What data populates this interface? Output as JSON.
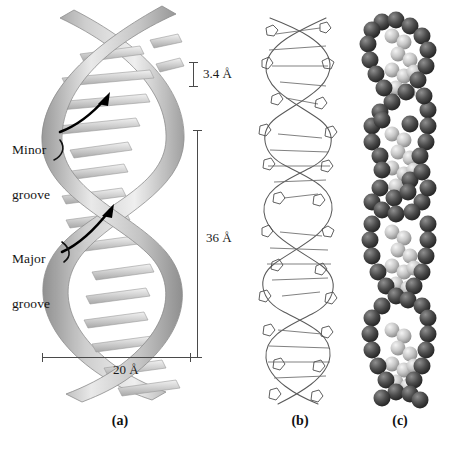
{
  "figure": {
    "background_color": "#ffffff",
    "panels": [
      {
        "id": "a",
        "letter": "(a)",
        "model": "ribbon-helix-schematic"
      },
      {
        "id": "b",
        "letter": "(b)",
        "model": "stick-wireframe-model"
      },
      {
        "id": "c",
        "letter": "(c)",
        "model": "space-filling-model"
      }
    ]
  },
  "annotations": {
    "minor_groove": "Minor\ngroove",
    "minor_groove_line1": "Minor",
    "minor_groove_line2": "groove",
    "major_groove_line1": "Major",
    "major_groove_line2": "groove"
  },
  "dimensions": {
    "rise_per_base_pair": "3.4 Å",
    "helical_turn": "36 Å",
    "helix_diameter": "20 Å"
  },
  "colors": {
    "ribbon_light": "#e8e8e8",
    "ribbon_mid": "#bdbdbd",
    "ribbon_dark": "#8e8e8e",
    "base_pair": "#cfcfcf",
    "stick_model": "#5a5a5a",
    "sphere_backbone": "#4a4a4a",
    "sphere_base": "#c2c2c2",
    "rule": "#4a4a4a",
    "arrow": "#000000",
    "text": "#141414"
  }
}
